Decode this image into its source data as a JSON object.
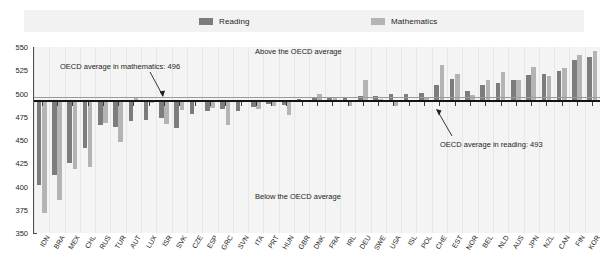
{
  "legend": {
    "items": [
      {
        "label": "Reading",
        "color": "#7c7c7c",
        "key": "reading"
      },
      {
        "label": "Mathematics",
        "color": "#b4b4b4",
        "key": "math"
      }
    ]
  },
  "annotations": {
    "math_average": "OECD average in mathematics: 496",
    "reading_average": "OECD average in reading: 493",
    "above": "Above the OECD average",
    "below": "Below the OECD average"
  },
  "chart_data": {
    "type": "bar",
    "title": "",
    "xlabel": "",
    "ylabel": "",
    "ylim": [
      350,
      550
    ],
    "yticks": [
      350,
      375,
      400,
      425,
      450,
      475,
      500,
      525,
      550
    ],
    "grid": true,
    "legend_position": "top",
    "reference_lines": [
      {
        "name": "OECD average in reading",
        "value": 493,
        "color": "#141414"
      },
      {
        "name": "OECD average in mathematics",
        "value": 496,
        "color": "#9a9a9a"
      }
    ],
    "categories": [
      "IDN",
      "BRA",
      "MEX",
      "CHL",
      "RUS",
      "TUR",
      "AUT",
      "LUX",
      "ISR",
      "SVK",
      "CZE",
      "ESP",
      "GRC",
      "SVN",
      "ITA",
      "PRT",
      "HUN",
      "GBR",
      "DNK",
      "FRA",
      "IRL",
      "DEU",
      "SWE",
      "USA",
      "ISL",
      "POL",
      "CHE",
      "EST",
      "NOR",
      "BEL",
      "NLD",
      "AUS",
      "JPN",
      "NZL",
      "CAN",
      "FIN",
      "KOR"
    ],
    "series": [
      {
        "name": "Reading",
        "color": "#7c7c7c",
        "values": [
          402,
          412,
          425,
          441,
          466,
          464,
          470,
          472,
          474,
          463,
          478,
          481,
          483,
          481,
          486,
          489,
          488,
          494,
          495,
          496,
          496,
          497,
          497,
          500,
          500,
          501,
          509,
          516,
          503,
          509,
          511,
          515,
          520,
          521,
          524,
          536,
          539
        ]
      },
      {
        "name": "Mathematics",
        "color": "#b4b4b4",
        "values": [
          371,
          386,
          419,
          421,
          468,
          448,
          496,
          490,
          467,
          482,
          493,
          484,
          466,
          493,
          483,
          487,
          477,
          492,
          500,
          495,
          487,
          514,
          494,
          487,
          493,
          495,
          531,
          521,
          498,
          515,
          523,
          514,
          529,
          519,
          527,
          541,
          546
        ]
      }
    ]
  }
}
